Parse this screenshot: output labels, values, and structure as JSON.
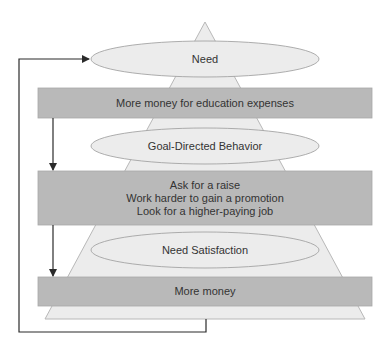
{
  "diagram": {
    "colors": {
      "triangle_fill": "#ececec",
      "triangle_stroke": "#b8b8b8",
      "bar_fill": "#b9b9b9",
      "bar_stroke": "#a8a8a8",
      "ellipse_fill": "#ececec",
      "ellipse_stroke": "#9a9a9a",
      "arrow": "#2b2b2b",
      "text": "#333333"
    },
    "ellipses": [
      {
        "label": "Need"
      },
      {
        "label": "Goal-Directed Behavior"
      },
      {
        "label": "Need Satisfaction"
      }
    ],
    "bars": [
      {
        "lines": [
          "More money for education expenses"
        ]
      },
      {
        "lines": [
          "Ask for a raise",
          "Work harder to gain a promotion",
          "Look for a higher-paying job"
        ]
      },
      {
        "lines": [
          "More money"
        ]
      }
    ]
  }
}
